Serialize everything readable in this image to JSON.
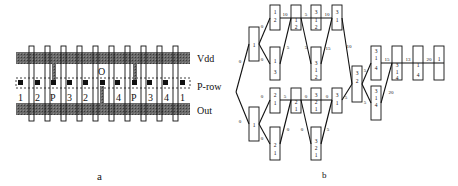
{
  "panel_a": {
    "caption": "a",
    "rails": {
      "top": "Vdd",
      "middle": "P-row",
      "bottom": "Out"
    },
    "column_labels": [
      "1",
      "2",
      "P",
      "3",
      "2",
      "",
      "4",
      "P",
      "3",
      "4",
      "1"
    ],
    "output_marker": "O",
    "colors": {
      "rail": "#555555",
      "contact": "#111111",
      "stroke": "#111111"
    }
  },
  "panel_b": {
    "caption": "b",
    "top_branch": {
      "entry_label": "0",
      "left_node": "1",
      "upper_row": [
        {
          "stack": [
            "1",
            "2"
          ]
        },
        {
          "stack": [
            "1",
            "2"
          ]
        },
        {
          "stack": [
            "3",
            "1",
            "2"
          ]
        },
        {
          "stack": [
            "3",
            "1"
          ]
        }
      ],
      "lower_row": [
        {
          "stack": [
            "1",
            "3"
          ]
        },
        {
          "stack": [
            "3",
            "1",
            "2"
          ]
        }
      ],
      "edge_labels": [
        "0",
        "0",
        "10",
        "2",
        "5",
        "5",
        "5",
        "10",
        "15",
        "10"
      ]
    },
    "bottom_branch": {
      "entry_label": "0",
      "left_node": "1",
      "upper_row": [
        {
          "stack": [
            "2",
            "1"
          ]
        },
        {
          "stack": [
            "2",
            "1"
          ]
        },
        {
          "stack": [
            "3",
            "2",
            "1"
          ]
        },
        {
          "stack": [
            "3",
            "1"
          ]
        }
      ],
      "lower_row": [
        {
          "stack": [
            "2",
            "1"
          ]
        },
        {
          "stack": [
            "3",
            "2",
            "1"
          ]
        }
      ],
      "edge_labels": [
        "0",
        "0",
        "5",
        "2",
        "0",
        "0",
        "0",
        "0",
        "5",
        "5"
      ]
    },
    "merge_node": {
      "stack": [
        "3",
        "2"
      ]
    },
    "right_chain": {
      "upper": [
        {
          "stack": [
            "3",
            "1",
            "4"
          ]
        }
      ],
      "lower": [
        {
          "stack": [
            "3",
            "1",
            "4"
          ]
        }
      ],
      "after": [
        {
          "stack": [
            "3",
            "1",
            "4"
          ]
        },
        {
          "stack": [
            "1",
            "4"
          ]
        },
        {
          "stack": [
            "1"
          ]
        }
      ],
      "edge_labels": [
        "5",
        "5",
        "15",
        "13",
        "20",
        "20",
        "10"
      ]
    }
  }
}
